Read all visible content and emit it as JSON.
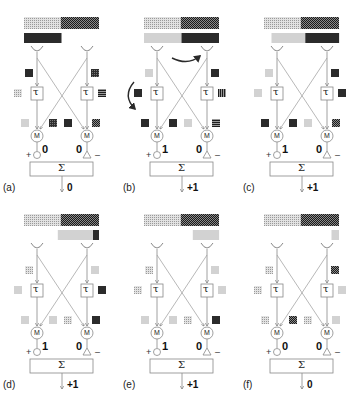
{
  "figure": {
    "patterns": {
      "light": "#d0d0d0",
      "light_dotted": "#c4c4c4",
      "dark": "#2a2a2a",
      "grid": "#3c3c3c",
      "checker": "#555555"
    },
    "panels": [
      {
        "id": "a",
        "label": "(a)",
        "top_bar": [
          "light_dotted",
          "checker"
        ],
        "second_bar": {
          "segments": [
            {
              "pattern": "dark",
              "from": 0,
              "to": 0.5
            }
          ]
        },
        "left_input_square": "dark",
        "right_input_square": "grid",
        "left_tau_side": "light_dotted",
        "right_tau_side": "hstripe",
        "m_row": [
          "light",
          "grid",
          "dark",
          "checker"
        ],
        "left_value": "0",
        "right_value": "0",
        "plus_sign": "+",
        "minus_sign": "–",
        "tau_symbol": "τ",
        "m_symbol": "M",
        "sum_symbol": "Σ",
        "output": "0",
        "arrows": false
      },
      {
        "id": "b",
        "label": "(b)",
        "top_bar": [
          "light_dotted",
          "checker"
        ],
        "second_bar": {
          "segments": [
            {
              "pattern": "light",
              "from": 0,
              "to": 0.5
            },
            {
              "pattern": "dark",
              "from": 0.5,
              "to": 1
            }
          ]
        },
        "left_input_square": "light",
        "right_input_square": "dark",
        "left_tau_side": "dark",
        "right_tau_side": "vstripe",
        "m_row": [
          "dark",
          "dark",
          "light",
          "hstripe"
        ],
        "left_value": "1",
        "right_value": "0",
        "plus_sign": "+",
        "minus_sign": "–",
        "tau_symbol": "τ",
        "m_symbol": "M",
        "sum_symbol": "Σ",
        "output": "+1",
        "arrows": true
      },
      {
        "id": "c",
        "label": "(c)",
        "top_bar": [
          "light_dotted",
          "checker"
        ],
        "second_bar": {
          "segments": [
            {
              "pattern": "light",
              "from": 0.1,
              "to": 0.55
            },
            {
              "pattern": "dark",
              "from": 0.55,
              "to": 1
            }
          ]
        },
        "left_input_square": "light",
        "right_input_square": "dark",
        "left_tau_side": "light",
        "right_tau_side": "dark",
        "m_row": [
          "dark",
          "dark",
          "light",
          "checker"
        ],
        "left_value": "1",
        "right_value": "0",
        "plus_sign": "+",
        "minus_sign": "–",
        "tau_symbol": "τ",
        "m_symbol": "M",
        "sum_symbol": "Σ",
        "output": "+1",
        "arrows": false
      },
      {
        "id": "d",
        "label": "(d)",
        "top_bar": [
          "light_dotted",
          "checker"
        ],
        "second_bar": {
          "segments": [
            {
              "pattern": "light",
              "from": 0.45,
              "to": 0.92
            },
            {
              "pattern": "dark",
              "from": 0.92,
              "to": 1
            }
          ]
        },
        "left_input_square": "light_dotted",
        "right_input_square": "light",
        "left_tau_side": "light",
        "right_tau_side": "dark",
        "m_row": [
          "light",
          "light",
          "light_dotted",
          "dark"
        ],
        "left_value": "1",
        "right_value": "0",
        "plus_sign": "+",
        "minus_sign": "–",
        "tau_symbol": "τ",
        "m_symbol": "M",
        "sum_symbol": "Σ",
        "output": "+1",
        "arrows": false
      },
      {
        "id": "e",
        "label": "(e)",
        "top_bar": [
          "light_dotted",
          "checker"
        ],
        "second_bar": {
          "segments": [
            {
              "pattern": "light",
              "from": 0.65,
              "to": 1
            }
          ]
        },
        "left_input_square": "light_dotted",
        "right_input_square": "light",
        "left_tau_side": "light_dotted",
        "right_tau_side": "light",
        "m_row": [
          "light",
          "light",
          "light_dotted",
          "dark"
        ],
        "left_value": "1",
        "right_value": "0",
        "plus_sign": "+",
        "minus_sign": "–",
        "tau_symbol": "τ",
        "m_symbol": "M",
        "sum_symbol": "Σ",
        "output": "+1",
        "arrows": false
      },
      {
        "id": "f",
        "label": "(f)",
        "top_bar": [
          "light_dotted",
          "checker"
        ],
        "second_bar": {
          "segments": [
            {
              "pattern": "light",
              "from": 0.9,
              "to": 1
            }
          ]
        },
        "left_input_square": "light_dotted",
        "right_input_square": "checker",
        "left_tau_side": "light_dotted",
        "right_tau_side": "light",
        "m_row": [
          "light_dotted",
          "checker",
          "light_dotted",
          "light"
        ],
        "left_value": "0",
        "right_value": "0",
        "plus_sign": "+",
        "minus_sign": "–",
        "tau_symbol": "τ",
        "m_symbol": "M",
        "sum_symbol": "Σ",
        "output": "0",
        "arrows": false
      }
    ]
  }
}
